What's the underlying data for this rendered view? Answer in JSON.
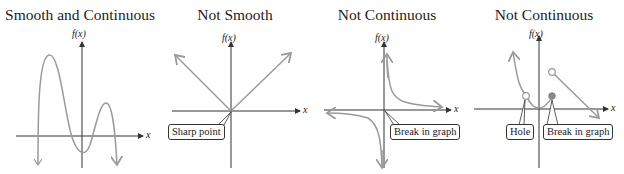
{
  "panels": [
    {
      "title": "Smooth and Continuous",
      "y_axis_label": "f(x)",
      "x_axis_label": "x",
      "callouts": []
    },
    {
      "title": "Not Smooth",
      "y_axis_label": "f(x)",
      "x_axis_label": "x",
      "callouts": [
        "Sharp point"
      ]
    },
    {
      "title": "Not Continuous",
      "y_axis_label": "f(x)",
      "x_axis_label": "x",
      "callouts": [
        "Break in graph"
      ]
    },
    {
      "title": "Not Continuous",
      "y_axis_label": "f(x)",
      "x_axis_label": "x",
      "callouts": [
        "Hole",
        "Break in graph"
      ]
    }
  ],
  "colors": {
    "axis": "#333333",
    "curve": "#9a9a9a",
    "text": "#222222"
  }
}
